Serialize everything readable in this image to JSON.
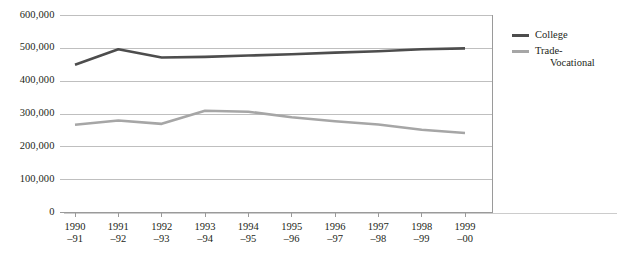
{
  "chart_data": {
    "type": "line",
    "title": "",
    "subtitle": "",
    "xlabel": "",
    "ylabel": "",
    "categories": [
      "1990–91",
      "1991–92",
      "1992–93",
      "1993–94",
      "1994–95",
      "1995–96",
      "1996–97",
      "1997–98",
      "1998–99",
      "1999–00"
    ],
    "category_lines": [
      [
        "1990",
        "–91"
      ],
      [
        "1991",
        "–92"
      ],
      [
        "1992",
        "–93"
      ],
      [
        "1993",
        "–94"
      ],
      [
        "1994",
        "–95"
      ],
      [
        "1995",
        "–96"
      ],
      [
        "1996",
        "–97"
      ],
      [
        "1997",
        "–98"
      ],
      [
        "1998",
        "–99"
      ],
      [
        "1999",
        "–00"
      ]
    ],
    "series": [
      {
        "name": "College",
        "color": "#4d4d4d",
        "values": [
          450000,
          497000,
          472000,
          474000,
          478000,
          482000,
          487000,
          491000,
          497000,
          500000
        ]
      },
      {
        "name": "Trade-Vocational",
        "name_lines": [
          "Trade-",
          "Vocational"
        ],
        "color": "#a6a6a6",
        "values": [
          267000,
          280000,
          270000,
          310000,
          307000,
          290000,
          278000,
          268000,
          252000,
          242000
        ]
      }
    ],
    "ylim": [
      0,
      600000
    ],
    "ytick_values": [
      0,
      100000,
      200000,
      300000,
      400000,
      500000,
      600000
    ],
    "ytick_labels": [
      "0",
      "100,000",
      "200,000",
      "300,000",
      "400,000",
      "500,000",
      "600,000"
    ],
    "grid": true,
    "grid_color": "#bfbfbf",
    "axis_color": "#808080",
    "legend_position": "right"
  },
  "legend": {
    "entries": [
      {
        "label": "College",
        "color": "#4d4d4d"
      },
      {
        "label_line1": "Trade-",
        "label_line2": "Vocational",
        "color": "#a6a6a6"
      }
    ]
  }
}
